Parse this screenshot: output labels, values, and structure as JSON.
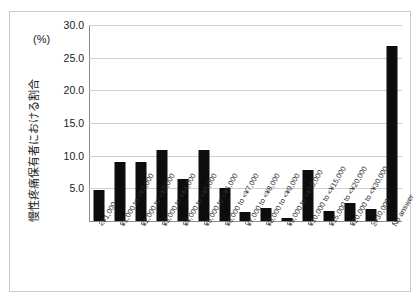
{
  "figure": {
    "unit_label": "(%)",
    "y_axis_title": "慢性疼痛保有者における割合"
  },
  "chart_data": {
    "type": "bar",
    "title": "",
    "subtitle": "",
    "xlabel": "",
    "ylabel": "慢性疼痛保有者における割合",
    "unit": "(%)",
    "ylim": [
      0,
      30
    ],
    "ytick_labels": [
      "30.0",
      "25.0",
      "20.0",
      "15.0",
      "10.0",
      "5.0"
    ],
    "ytick_values": [
      30,
      25,
      20,
      15,
      10,
      5
    ],
    "grid": true,
    "legend": "none",
    "bar_color": "#0d0d0d",
    "categories": [
      "<¥1,000",
      "¥1,000 to <¥2,000",
      "¥2,000 to <¥3,000",
      "¥3,000 to <¥4,000",
      "¥4,000 to <¥5,000",
      "¥5,000 to <¥6,000",
      "¥6,000 to <¥7,000",
      "¥7,000 to <¥8,000",
      "¥8,000 to <¥9,000",
      "¥9,000 to <¥10,000",
      "¥10,000 to <¥15,000",
      "¥15,000 to <¥20,000",
      "¥20,000 to <¥30,000",
      "≥¥30,000",
      "No answer"
    ],
    "values": [
      4.8,
      9.1,
      9.1,
      10.9,
      6.4,
      10.8,
      5.0,
      1.4,
      2.0,
      0.5,
      7.8,
      1.6,
      2.8,
      1.9,
      26.8
    ]
  }
}
